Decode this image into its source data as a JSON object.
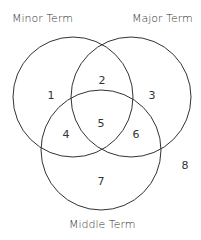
{
  "diagram": {
    "type": "venn",
    "labels": {
      "minor": "Minor Term",
      "major": "Major Term",
      "middle": "Middle Term"
    },
    "regions": [
      "1",
      "2",
      "3",
      "4",
      "5",
      "6",
      "7",
      "8"
    ],
    "stroke_color": "#333333"
  }
}
